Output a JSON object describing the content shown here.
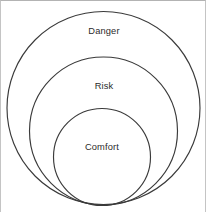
{
  "figure": {
    "background_color": "#ffffff",
    "frame_border_color": "#b3b3b3",
    "stroke_color": "#3a3a3a",
    "label_color": "#2b2b2b",
    "width": 206,
    "height": 212
  },
  "chart_data": {
    "type": "diagram",
    "subtype": "nested-concentric-circles",
    "title": "",
    "xlabel": "",
    "ylabel": "",
    "grid": false,
    "legend": "none",
    "categories": [
      "Danger",
      "Risk",
      "Comfort"
    ],
    "values": [
      96.5,
      74,
      48.5
    ],
    "series": [
      {
        "name": "circle radius (px)",
        "values": [
          96.5,
          74,
          48.5
        ]
      }
    ],
    "circles": [
      {
        "label": "Danger",
        "level": 1,
        "position": "outer",
        "cx": 102.5,
        "cy": 107,
        "r": 96.5,
        "stroke": "#3a3a3a",
        "fill": "none",
        "label_x": 103,
        "label_y": 31
      },
      {
        "label": "Risk",
        "level": 2,
        "position": "middle",
        "cx": 102.5,
        "cy": 130,
        "r": 74,
        "stroke": "#3a3a3a",
        "fill": "none",
        "label_x": 103,
        "label_y": 86
      },
      {
        "label": "Comfort",
        "level": 3,
        "position": "inner",
        "cx": 101,
        "cy": 156,
        "r": 48.5,
        "stroke": "#3a3a3a",
        "fill": "none",
        "label_x": 101,
        "label_y": 147
      }
    ]
  },
  "labels": {
    "outer": "Danger",
    "middle": "Risk",
    "inner": "Comfort"
  }
}
